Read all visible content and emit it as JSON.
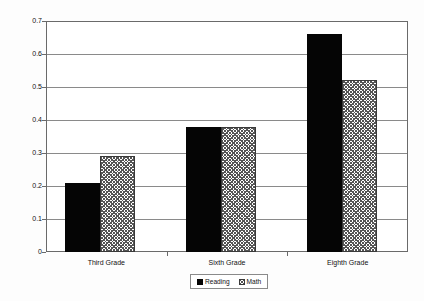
{
  "chart_data": {
    "type": "bar",
    "title": "",
    "xlabel": "",
    "ylabel": "Achievement Gain (Grade Equivalents)",
    "categories": [
      "Third Grade",
      "Sixth Grade",
      "Eighth Grade"
    ],
    "series": [
      {
        "name": "Reading",
        "values": [
          0.21,
          0.38,
          0.66
        ],
        "color": "#050505",
        "fill": "solid"
      },
      {
        "name": "Math",
        "values": [
          0.29,
          0.38,
          0.52
        ],
        "color": "#555555",
        "fill": "crosshatch"
      }
    ],
    "ylim": [
      0,
      0.7
    ],
    "yticks": [
      0,
      0.1,
      0.2,
      0.3,
      0.4,
      0.5,
      0.6,
      0.7
    ],
    "ytick_labels": [
      "0",
      "0.1",
      "0.2",
      "0.3",
      "0.4",
      "0.5",
      "0.6",
      "0.7"
    ],
    "grid": true,
    "grid_axis": "y",
    "legend_position": "bottom",
    "legend_entries": [
      "Reading",
      "Math"
    ]
  }
}
